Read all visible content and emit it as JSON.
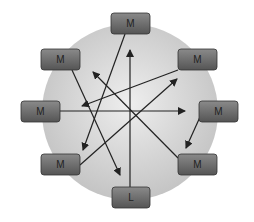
{
  "diagram": {
    "circle": {
      "cx": 130,
      "cy": 112,
      "r": 88,
      "fill_center": "#eeeeee",
      "fill_edge": "#c4c4c4"
    },
    "node_style": {
      "fill_top": "#8a8a8a",
      "fill_bottom": "#555555",
      "stroke": "#333333",
      "text_color": "#222222"
    },
    "nodes": [
      {
        "id": "top",
        "label": "M",
        "x": 111,
        "y": 13,
        "w": 39,
        "h": 21
      },
      {
        "id": "top-left",
        "label": "M",
        "x": 41,
        "y": 49,
        "w": 39,
        "h": 21
      },
      {
        "id": "top-right",
        "label": "M",
        "x": 178,
        "y": 49,
        "w": 39,
        "h": 21
      },
      {
        "id": "left",
        "label": "M",
        "x": 21,
        "y": 101,
        "w": 39,
        "h": 21
      },
      {
        "id": "right",
        "label": "M",
        "x": 199,
        "y": 101,
        "w": 39,
        "h": 21
      },
      {
        "id": "bottom-left",
        "label": "M",
        "x": 41,
        "y": 154,
        "w": 39,
        "h": 21
      },
      {
        "id": "bottom-right",
        "label": "M",
        "x": 178,
        "y": 154,
        "w": 39,
        "h": 21
      },
      {
        "id": "bottom",
        "label": "L",
        "x": 112,
        "y": 187,
        "w": 38,
        "h": 21
      }
    ],
    "arrows": [
      {
        "from": "top",
        "x1": 125,
        "y1": 34,
        "x2": 83,
        "y2": 150
      },
      {
        "from": "bottom",
        "x1": 130,
        "y1": 187,
        "x2": 130,
        "y2": 50
      },
      {
        "from": "top-left",
        "x1": 72,
        "y1": 70,
        "x2": 120,
        "y2": 175
      },
      {
        "from": "top-right",
        "x1": 178,
        "y1": 70,
        "x2": 82,
        "y2": 106
      },
      {
        "from": "left",
        "x1": 60,
        "y1": 111,
        "x2": 185,
        "y2": 111
      },
      {
        "from": "bottom-left",
        "x1": 80,
        "y1": 165,
        "x2": 177,
        "y2": 79
      },
      {
        "from": "bottom-right",
        "x1": 178,
        "y1": 158,
        "x2": 93,
        "y2": 72
      },
      {
        "from": "right",
        "x1": 200,
        "y1": 117,
        "x2": 186,
        "y2": 148
      }
    ],
    "arrow_color": "#222222"
  }
}
